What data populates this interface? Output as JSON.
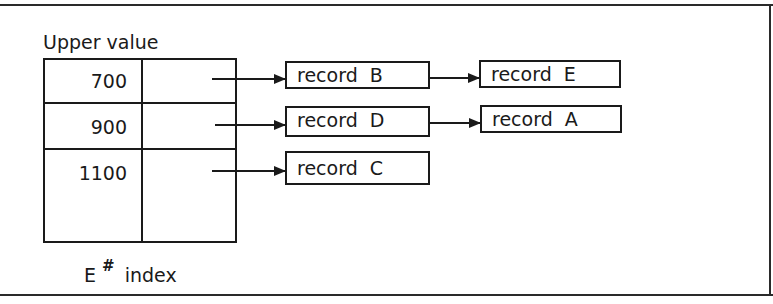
{
  "diagram": {
    "header_label": "Upper value",
    "footer_label_main": "E",
    "footer_label_sup": "#",
    "footer_label_rest": "index",
    "index_rows": [
      {
        "upper_value": "700"
      },
      {
        "upper_value": "900"
      },
      {
        "upper_value": "1100"
      }
    ],
    "chains": [
      {
        "records": [
          "record  B",
          "record  E"
        ]
      },
      {
        "records": [
          "record  D",
          "record  A"
        ]
      },
      {
        "records": [
          "record  C"
        ]
      }
    ]
  }
}
